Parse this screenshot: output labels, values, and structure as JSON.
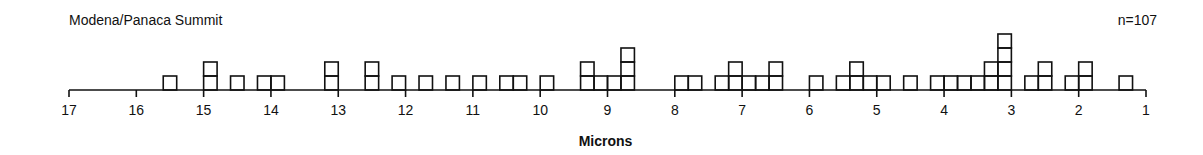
{
  "chart_data": {
    "type": "histogram",
    "title": "Modena/Panaca Summit",
    "annotation": "n=107",
    "xlabel": "Microns",
    "ylabel": "",
    "x_axis_reversed": true,
    "xlim": [
      17,
      1
    ],
    "x_ticks": [
      17,
      16,
      15,
      14,
      13,
      12,
      11,
      10,
      9,
      8,
      7,
      6,
      5,
      4,
      3,
      2,
      1
    ],
    "bin_width": 0.2,
    "grid": false,
    "legend": null,
    "bins": [
      {
        "from": 15.6,
        "to": 15.4,
        "count": 1
      },
      {
        "from": 15.0,
        "to": 14.8,
        "count": 2
      },
      {
        "from": 14.6,
        "to": 14.4,
        "count": 1
      },
      {
        "from": 14.2,
        "to": 14.0,
        "count": 1
      },
      {
        "from": 14.0,
        "to": 13.8,
        "count": 1
      },
      {
        "from": 13.2,
        "to": 13.0,
        "count": 2
      },
      {
        "from": 12.6,
        "to": 12.4,
        "count": 2
      },
      {
        "from": 12.2,
        "to": 12.0,
        "count": 1
      },
      {
        "from": 11.8,
        "to": 11.6,
        "count": 1
      },
      {
        "from": 11.4,
        "to": 11.2,
        "count": 1
      },
      {
        "from": 11.0,
        "to": 10.8,
        "count": 1
      },
      {
        "from": 10.6,
        "to": 10.4,
        "count": 1
      },
      {
        "from": 10.4,
        "to": 10.2,
        "count": 1
      },
      {
        "from": 10.0,
        "to": 9.8,
        "count": 1
      },
      {
        "from": 9.4,
        "to": 9.2,
        "count": 2
      },
      {
        "from": 9.2,
        "to": 9.0,
        "count": 1
      },
      {
        "from": 9.0,
        "to": 8.8,
        "count": 1
      },
      {
        "from": 8.8,
        "to": 8.6,
        "count": 3
      },
      {
        "from": 8.0,
        "to": 7.8,
        "count": 1
      },
      {
        "from": 7.8,
        "to": 7.6,
        "count": 1
      },
      {
        "from": 7.4,
        "to": 7.2,
        "count": 1
      },
      {
        "from": 7.2,
        "to": 7.0,
        "count": 2
      },
      {
        "from": 7.0,
        "to": 6.8,
        "count": 1
      },
      {
        "from": 6.8,
        "to": 6.6,
        "count": 1
      },
      {
        "from": 6.6,
        "to": 6.4,
        "count": 2
      },
      {
        "from": 6.0,
        "to": 5.8,
        "count": 1
      },
      {
        "from": 5.6,
        "to": 5.4,
        "count": 1
      },
      {
        "from": 5.4,
        "to": 5.2,
        "count": 2
      },
      {
        "from": 5.2,
        "to": 5.0,
        "count": 1
      },
      {
        "from": 5.0,
        "to": 4.8,
        "count": 1
      },
      {
        "from": 4.6,
        "to": 4.4,
        "count": 1
      },
      {
        "from": 4.2,
        "to": 4.0,
        "count": 1
      },
      {
        "from": 4.0,
        "to": 3.8,
        "count": 1
      },
      {
        "from": 3.8,
        "to": 3.6,
        "count": 1
      },
      {
        "from": 3.6,
        "to": 3.4,
        "count": 1
      },
      {
        "from": 3.4,
        "to": 3.2,
        "count": 2
      },
      {
        "from": 3.2,
        "to": 3.0,
        "count": 4
      },
      {
        "from": 2.8,
        "to": 2.6,
        "count": 1
      },
      {
        "from": 2.6,
        "to": 2.4,
        "count": 2
      },
      {
        "from": 2.2,
        "to": 2.0,
        "count": 1
      },
      {
        "from": 2.0,
        "to": 1.8,
        "count": 2
      },
      {
        "from": 1.4,
        "to": 1.2,
        "count": 1
      }
    ]
  },
  "header": {
    "title": "Modena/Panaca Summit",
    "sample_size": "n=107"
  },
  "axis": {
    "label": "Microns"
  }
}
